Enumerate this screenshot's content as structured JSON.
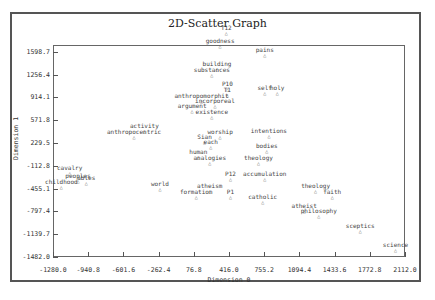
{
  "chart_data": {
    "type": "scatter",
    "title": "2D-Scatter Graph",
    "xlabel": "Dimension 0",
    "ylabel": "Dimension 1",
    "xlim": [
      -1280.0,
      2112.0
    ],
    "ylim": [
      -1482.0,
      1941.0
    ],
    "x_ticks": [
      "-1280.0",
      "-940.8",
      "-601.6",
      "-262.4",
      "76.8",
      "416.0",
      "755.2",
      "1094.4",
      "1433.6",
      "1772.8",
      "2112.0"
    ],
    "y_ticks": [
      "1598.7",
      "1256.4",
      "914.1",
      "571.8",
      "229.5",
      "-112.8",
      "-455.1",
      "-797.4",
      "-1139.7",
      "-1482.0"
    ],
    "grid": false,
    "legend": null,
    "marker": "triangle",
    "points": [
      {
        "label": "T12",
        "x": 390,
        "y": 1900
      },
      {
        "label": "goodness",
        "x": 330,
        "y": 1700
      },
      {
        "label": "pains",
        "x": 760,
        "y": 1560
      },
      {
        "label": "building",
        "x": 300,
        "y": 1350
      },
      {
        "label": "substances",
        "x": 250,
        "y": 1260
      },
      {
        "label": "P10",
        "x": 400,
        "y": 1060
      },
      {
        "label": "T1",
        "x": 400,
        "y": 960
      },
      {
        "label": "self",
        "x": 760,
        "y": 1000
      },
      {
        "label": "holy",
        "x": 880,
        "y": 1000
      },
      {
        "label": "anthropomorphit",
        "x": 150,
        "y": 880
      },
      {
        "label": "incorporeal",
        "x": 280,
        "y": 800
      },
      {
        "label": "argument",
        "x": 60,
        "y": 720
      },
      {
        "label": "existence",
        "x": 250,
        "y": 640
      },
      {
        "label": "intentions",
        "x": 800,
        "y": 350
      },
      {
        "label": "activity",
        "x": -400,
        "y": 420
      },
      {
        "label": "anthropocentric",
        "x": -500,
        "y": 340
      },
      {
        "label": "worship",
        "x": 330,
        "y": 340
      },
      {
        "label": "Sian",
        "x": 180,
        "y": 260
      },
      {
        "label": "each",
        "x": 240,
        "y": 180
      },
      {
        "label": "bodies",
        "x": 780,
        "y": 120
      },
      {
        "label": "human",
        "x": 120,
        "y": 40
      },
      {
        "label": "analogies",
        "x": 230,
        "y": -60
      },
      {
        "label": "theology",
        "x": 700,
        "y": -50
      },
      {
        "label": "cavalry",
        "x": -1120,
        "y": -210
      },
      {
        "label": "peoples",
        "x": -1040,
        "y": -320
      },
      {
        "label": "ables",
        "x": -960,
        "y": -350
      },
      {
        "label": "childhood",
        "x": -1200,
        "y": -420
      },
      {
        "label": "P12",
        "x": 430,
        "y": -290
      },
      {
        "label": "accumulation",
        "x": 760,
        "y": -290
      },
      {
        "label": "world",
        "x": -250,
        "y": -440
      },
      {
        "label": "atheism",
        "x": 230,
        "y": -470
      },
      {
        "label": "formation",
        "x": 100,
        "y": -570
      },
      {
        "label": "P1",
        "x": 430,
        "y": -560
      },
      {
        "label": "theology",
        "x": 1250,
        "y": -480
      },
      {
        "label": "faith",
        "x": 1410,
        "y": -560
      },
      {
        "label": "catholic",
        "x": 740,
        "y": -640
      },
      {
        "label": "atheist",
        "x": 1140,
        "y": -770
      },
      {
        "label": "philosophy",
        "x": 1280,
        "y": -850
      },
      {
        "label": "sceptics",
        "x": 1680,
        "y": -1080
      },
      {
        "label": "science",
        "x": 2020,
        "y": -1360
      }
    ]
  },
  "axes": {
    "x_title": "Dimension 0",
    "y_title": "Dimension 1"
  }
}
